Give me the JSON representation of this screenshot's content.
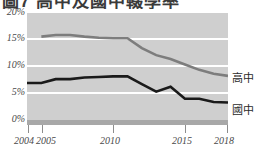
{
  "title": "圖7 高中及國中輟學率",
  "colors": {
    "plot_background": "#cfcfcf",
    "gridline": "#ffffff",
    "senior_high_line": "#7d7d7d",
    "junior_high_line": "#1a1a1a",
    "axis_band": "#a8a8a8",
    "label_text": "#4a4a4a"
  },
  "chart_data": {
    "type": "line",
    "title": "圖7 高中及國中輟學率",
    "xlabel": "",
    "ylabel": "",
    "xlim": [
      2004,
      2018
    ],
    "ylim": [
      0,
      20
    ],
    "grid": true,
    "legend_position": "right-end-of-line",
    "ytick_labels": [
      "0%",
      "5%",
      "10%",
      "15%",
      "20%"
    ],
    "ytick_values": [
      0,
      5,
      10,
      15,
      20
    ],
    "xtick_labels": [
      "2004",
      "2005",
      "2010",
      "2015",
      "2018"
    ],
    "xtick_values": [
      2004,
      2005,
      2010,
      2015,
      2018
    ],
    "x": [
      2004,
      2005,
      2006,
      2007,
      2008,
      2009,
      2010,
      2011,
      2012,
      2013,
      2014,
      2015,
      2016,
      2017,
      2018
    ],
    "series": [
      {
        "name": "高中",
        "color": "#7d7d7d",
        "values": [
          null,
          15.3,
          15.6,
          15.6,
          15.3,
          15.1,
          15.0,
          15.0,
          13.2,
          11.9,
          11.2,
          10.2,
          9.2,
          8.5,
          8.1
        ]
      },
      {
        "name": "國中",
        "color": "#1a1a1a",
        "values": [
          6.8,
          6.8,
          7.5,
          7.5,
          7.8,
          7.9,
          8.0,
          8.0,
          6.6,
          5.2,
          6.1,
          3.9,
          3.9,
          3.3,
          3.2
        ]
      }
    ]
  },
  "axis": {
    "y_labels": [
      "20%",
      "15%",
      "10%",
      "5%",
      "0%"
    ],
    "x_labels": [
      "2004",
      "2005",
      "2010",
      "2015",
      "2018"
    ]
  },
  "legend": {
    "senior_high": "高中",
    "junior_high": "國中"
  }
}
